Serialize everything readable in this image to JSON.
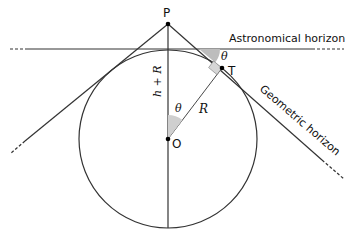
{
  "diagram": {
    "title": "",
    "labels": {
      "P": "P",
      "T": "T",
      "O": "O",
      "theta_top": "θ",
      "theta_center": "θ",
      "radius": "R",
      "height": "h + R",
      "astronomical_horizon": "Astronomical horizon",
      "geometric_horizon": "Geometric horizon"
    },
    "colors": {
      "line": "#333333",
      "angle_fill": "#bdbdbd",
      "right_angle_fill": "#d6d6d6",
      "point": "#000000"
    },
    "nodes": [
      {
        "id": "P",
        "label": "P",
        "description": "observer point above sphere"
      },
      {
        "id": "T",
        "label": "T",
        "description": "tangent point on sphere"
      },
      {
        "id": "O",
        "label": "O",
        "description": "center of sphere"
      }
    ],
    "edges": [
      {
        "from": "O",
        "to": "P",
        "label": "h + R"
      },
      {
        "from": "O",
        "to": "T",
        "label": "R"
      },
      {
        "from": "P",
        "to": "T",
        "label": "Geometric horizon"
      }
    ]
  }
}
